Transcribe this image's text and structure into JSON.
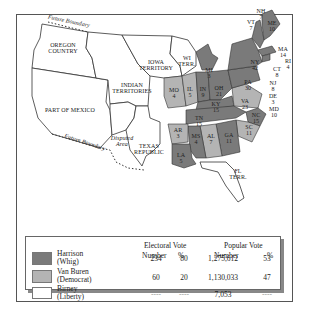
{
  "map": {
    "regions": {
      "oregon": "OREGON\nCOUNTRY",
      "mexico": "PART OF MEXICO",
      "indian": "INDIAN\nTERRITORIES",
      "iowa": "IOWA\nTERRITORY",
      "wi": "WI\nTERR.",
      "disputed": "Disputed\nArea",
      "texas": "TEXAS\nREPUBLIC",
      "florida": "FL\nTERR.",
      "future_boundary_n": "Future Boundary",
      "future_boundary_s": "Future Boundary"
    },
    "states": [
      {
        "abbr": "NH",
        "ev": "7",
        "party": "harrison"
      },
      {
        "abbr": "VT",
        "ev": "7",
        "party": "harrison"
      },
      {
        "abbr": "ME",
        "ev": "10",
        "party": "harrison"
      },
      {
        "abbr": "MA",
        "ev": "14",
        "party": "harrison"
      },
      {
        "abbr": "RI",
        "ev": "4",
        "party": "harrison"
      },
      {
        "abbr": "CT",
        "ev": "8",
        "party": "harrison"
      },
      {
        "abbr": "NY",
        "ev": "42",
        "party": "harrison"
      },
      {
        "abbr": "NJ",
        "ev": "8",
        "party": "harrison"
      },
      {
        "abbr": "DE",
        "ev": "3",
        "party": "harrison"
      },
      {
        "abbr": "MD",
        "ev": "10",
        "party": "harrison"
      },
      {
        "abbr": "PA",
        "ev": "30",
        "party": "harrison"
      },
      {
        "abbr": "VA",
        "ev": "23",
        "party": "vanburen"
      },
      {
        "abbr": "NC",
        "ev": "15",
        "party": "harrison"
      },
      {
        "abbr": "SC",
        "ev": "11",
        "party": "vanburen"
      },
      {
        "abbr": "GA",
        "ev": "11",
        "party": "harrison"
      },
      {
        "abbr": "AL",
        "ev": "7",
        "party": "vanburen"
      },
      {
        "abbr": "MS",
        "ev": "4",
        "party": "harrison"
      },
      {
        "abbr": "LA",
        "ev": "5",
        "party": "harrison"
      },
      {
        "abbr": "AR",
        "ev": "3",
        "party": "vanburen"
      },
      {
        "abbr": "TN",
        "ev": "15",
        "party": "harrison"
      },
      {
        "abbr": "KY",
        "ev": "15",
        "party": "harrison"
      },
      {
        "abbr": "OH",
        "ev": "21",
        "party": "harrison"
      },
      {
        "abbr": "IN",
        "ev": "9",
        "party": "harrison"
      },
      {
        "abbr": "IL",
        "ev": "5",
        "party": "vanburen"
      },
      {
        "abbr": "MO",
        "ev": "4",
        "party": "vanburen"
      },
      {
        "abbr": "MI",
        "ev": "3",
        "party": "harrison"
      }
    ]
  },
  "colors": {
    "harrison": "#7a7a7a",
    "vanburen": "#b4b4b4",
    "birney": "#ffffff",
    "territory": "#ffffff"
  },
  "legend": {
    "electoral_header": "Electoral Vote",
    "popular_header": "Popular Vote",
    "number_label": "Number",
    "pct_label": "%",
    "rows": [
      {
        "name": "Harrison",
        "party": "(Whig)",
        "ev_number": "234",
        "ev_pct": "80",
        "pop_number": "1,275,612",
        "pop_pct": "53"
      },
      {
        "name": "Van Buren",
        "party": "(Democrat)",
        "ev_number": "60",
        "ev_pct": "20",
        "pop_number": "1,130,033",
        "pop_pct": "47"
      },
      {
        "name": "Birney",
        "party": "(Liberty)",
        "ev_number": "----",
        "ev_pct": "----",
        "pop_number": "7,053",
        "pop_pct": "----"
      }
    ]
  }
}
